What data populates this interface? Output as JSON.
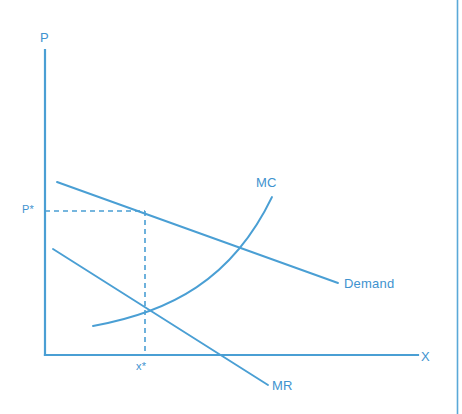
{
  "figure": {
    "type": "line-diagram",
    "colors": {
      "line": "#4a9fd4",
      "axis": "#4a9fd4",
      "dashed": "#4a9fd4",
      "label": "#3f93cf",
      "border": "#5aa9d8",
      "background": "#ffffff"
    },
    "axes": {
      "y_label": "P",
      "x_label": "X",
      "origin": {
        "x": 45,
        "y": 355
      },
      "y_top": {
        "x": 45,
        "y": 50
      },
      "x_right": {
        "x": 418,
        "y": 355
      }
    },
    "labels": {
      "price_star": "P*",
      "quantity_star": "x*",
      "demand": "Demand",
      "marginal_cost": "MC",
      "marginal_revenue": "MR"
    },
    "label_positions": {
      "y_axis": {
        "x": 40,
        "y": 30
      },
      "x_axis": {
        "x": 421,
        "y": 351
      },
      "price_star": {
        "x": 22,
        "y": 204
      },
      "quantity_star": {
        "x": 136,
        "y": 361
      },
      "demand": {
        "x": 344,
        "y": 277
      },
      "marginal_cost": {
        "x": 256,
        "y": 176
      },
      "marginal_revenue": {
        "x": 272,
        "y": 379
      }
    },
    "curves": {
      "demand": {
        "name": "Demand",
        "kind": "straight-downward-sloping",
        "start": {
          "x": 57,
          "y": 182
        },
        "end": {
          "x": 338,
          "y": 283
        }
      },
      "marginal_revenue": {
        "name": "MR",
        "kind": "straight-downward-sloping-steeper",
        "start": {
          "x": 53,
          "y": 249
        },
        "end": {
          "x": 268,
          "y": 385
        },
        "x_axis_crossing": {
          "x": 222,
          "y": 355
        }
      },
      "marginal_cost": {
        "name": "MC",
        "kind": "upward-sloping-convex",
        "start": {
          "x": 93,
          "y": 326
        },
        "control_1": {
          "x": 170,
          "y": 312
        },
        "control_2": {
          "x": 232,
          "y": 280
        },
        "end": {
          "x": 272,
          "y": 197
        }
      }
    },
    "equilibrium": {
      "price_level_y": 211,
      "quantity_level_x": 145,
      "mr_mc_intersection": {
        "x": 145,
        "y": 308
      },
      "mc_demand_intersection": {
        "x": 228,
        "y": 245
      },
      "price_point_on_demand": {
        "x": 145,
        "y": 211
      }
    },
    "guides": {
      "horizontal_dashed": {
        "x1": 45,
        "y1": 211,
        "x2": 145,
        "y2": 211
      },
      "vertical_dashed": {
        "x1": 145,
        "y1": 211,
        "x2": 145,
        "y2": 355
      }
    },
    "frame": {
      "right_border_x": 457
    }
  }
}
